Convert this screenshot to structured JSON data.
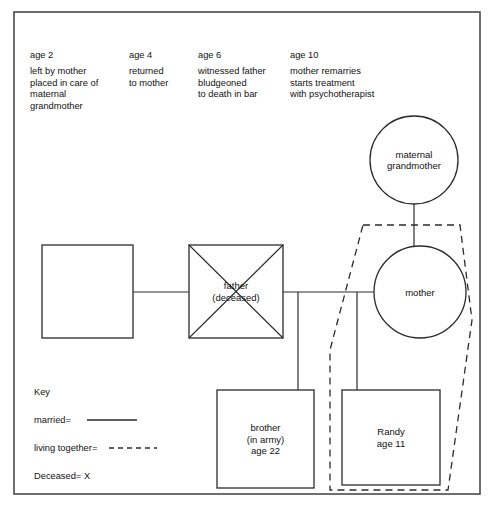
{
  "diagram": {
    "type": "genogram",
    "frame": {
      "x": 14,
      "y": 12,
      "width": 466,
      "height": 482
    }
  },
  "timeline": {
    "entries": [
      {
        "age_label": "age 2",
        "text": "left by mother\nplaced in care of\nmaternal\ngrandmother",
        "x": 30
      },
      {
        "age_label": "age 4",
        "text": "returned\nto mother",
        "x": 129
      },
      {
        "age_label": "age 6",
        "text": "witnessed father\nbludgeoned\nto death in bar",
        "x": 198
      },
      {
        "age_label": "age 10",
        "text": "mother remarries\nstarts treatment\nwith psychotherapist",
        "x": 290
      }
    ],
    "age_row_y": 56,
    "text_row_y": 71
  },
  "nodes": [
    {
      "id": "maternal-grandmother",
      "kind": "circle",
      "label_lines": [
        "maternal",
        "grandmother"
      ],
      "cx": 414,
      "cy": 160,
      "r": 44,
      "deceased": false
    },
    {
      "id": "mother",
      "kind": "circle",
      "label_lines": [
        "mother"
      ],
      "cx": 420,
      "cy": 292,
      "r": 46,
      "deceased": false
    },
    {
      "id": "unnamed-male",
      "kind": "square",
      "label_lines": [],
      "x": 42,
      "y": 245,
      "width": 91,
      "height": 93,
      "deceased": false
    },
    {
      "id": "father",
      "kind": "square",
      "label_lines": [
        "father",
        "(deceased)"
      ],
      "x": 189,
      "y": 245,
      "width": 94,
      "height": 93,
      "deceased": true
    },
    {
      "id": "brother",
      "kind": "square",
      "label_lines": [
        "brother",
        "(in army)",
        "age 22"
      ],
      "x": 217,
      "y": 390,
      "width": 97,
      "height": 98,
      "deceased": false
    },
    {
      "id": "randy",
      "kind": "square",
      "label_lines": [
        "Randy",
        "age 11"
      ],
      "x": 342,
      "y": 390,
      "width": 98,
      "height": 95,
      "deceased": false
    }
  ],
  "links": [
    {
      "id": "link-unnamed-to-father",
      "kind": "married",
      "points": "133,292 189,292"
    },
    {
      "id": "link-father-to-mother",
      "kind": "married",
      "points": "283,292 374,292"
    },
    {
      "id": "link-grandmother-to-mother",
      "kind": "parent",
      "points": "414,204 414,246"
    },
    {
      "id": "link-sibship-to-brother",
      "kind": "child",
      "points": "298,292 298,390"
    },
    {
      "id": "link-sibship-to-randy",
      "kind": "child",
      "points": "357,292 357,390"
    }
  ],
  "household": {
    "id": "living-together-household",
    "style": "dashed",
    "points": "363,225 460,225 472,320 448,490 330,490 330,350 363,225"
  },
  "key": {
    "title": "Key",
    "items": [
      {
        "label": "married=",
        "symbol": "solid-line"
      },
      {
        "label": "living together=",
        "symbol": "dashed-line"
      },
      {
        "label": "Deceased= X",
        "symbol": "none"
      }
    ],
    "x": 34,
    "title_y": 392,
    "row_spacing": 28
  },
  "colors": {
    "stroke": "#2b2b2b",
    "frame": "#4a4a4a",
    "background": "#ffffff",
    "text": "#111111"
  }
}
